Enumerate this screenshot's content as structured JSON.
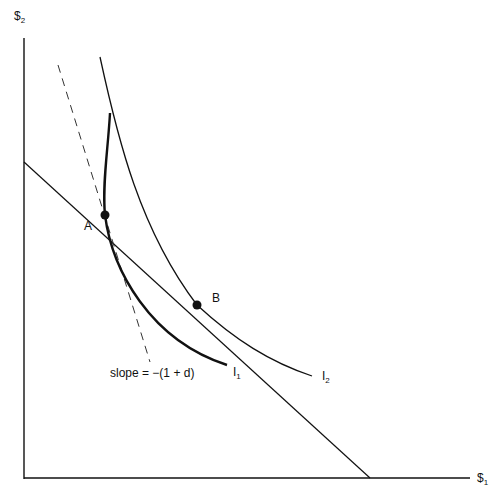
{
  "axes": {
    "y_label": "$",
    "y_sub": "2",
    "x_label": "$",
    "x_sub": "1"
  },
  "points": {
    "a": "A",
    "b": "B"
  },
  "curves": {
    "i1_label": "I",
    "i1_sub": "1",
    "i2_label": "I",
    "i2_sub": "2"
  },
  "annotations": {
    "slope": "slope = −(1 + d)"
  },
  "colors": {
    "ink": "#111111",
    "background": "#ffffff"
  }
}
